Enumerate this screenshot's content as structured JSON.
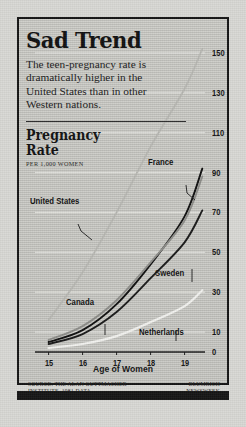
{
  "title": "Sad Trend",
  "intro": "The teen-pregnancy rate is dramatically higher in the United States than in other Western nations.",
  "axis_block": {
    "heading_line1": "Pregnancy",
    "heading_line2": "Rate",
    "units": "PER 1,000 WOMEN"
  },
  "credits": {
    "source": "SOURCE: THE ALAN GUTTMACHER INSTITUTE, 1981 DATA.",
    "artist_line1": "BLUMRICH",
    "artist_line2": "NEWSWEEK"
  },
  "colors": {
    "background": "#d9d9d5",
    "panel": "#cdcdc8",
    "frame": "#151515",
    "ink": "#121212",
    "united_states": "#b9b9b4",
    "france": "#101010",
    "sweden": "#1a1a1a",
    "canada": "#8e8e8a",
    "netherlands": "#f2f2ef",
    "gridline": "#e7e7e3"
  },
  "chart_data": {
    "type": "line",
    "title": "Pregnancy Rate",
    "xlabel": "Age of Women",
    "ylabel": "PER 1,000 WOMEN",
    "x": [
      15,
      16,
      17,
      18,
      19
    ],
    "xticklabels": [
      "15",
      "16",
      "17",
      "18",
      "19"
    ],
    "yticklabels": [
      "0",
      "10",
      "30",
      "50",
      "70",
      "90",
      "110",
      "130",
      "150"
    ],
    "ytickvalues": [
      0,
      10,
      30,
      50,
      70,
      90,
      110,
      130,
      150
    ],
    "ylim": [
      0,
      160
    ],
    "xlim": [
      14.6,
      19.6
    ],
    "grid": true,
    "legend": "inline-labels",
    "series": [
      {
        "name": "United States",
        "color": "#b9b9b4",
        "values": [
          16,
          40,
          70,
          103,
          132
        ],
        "end_value": 152
      },
      {
        "name": "France",
        "color": "#101010",
        "values": [
          5,
          11,
          24,
          44,
          68
        ],
        "end_value": 92
      },
      {
        "name": "Sweden",
        "color": "#1a1a1a",
        "values": [
          4,
          9,
          20,
          37,
          55
        ],
        "end_value": 71
      },
      {
        "name": "Canada",
        "color": "#8e8e8a",
        "values": [
          6,
          13,
          26,
          45,
          66
        ],
        "end_value": 88
      },
      {
        "name": "Netherlands",
        "color": "#f2f2ef",
        "values": [
          2,
          4,
          8,
          15,
          23
        ],
        "end_value": 31
      }
    ],
    "annotations": [
      {
        "label": "United States",
        "x": 30,
        "y": 196
      },
      {
        "label": "France",
        "x": 148,
        "y": 157
      },
      {
        "label": "Sweden",
        "x": 155,
        "y": 268
      },
      {
        "label": "Canada",
        "x": 66,
        "y": 297
      },
      {
        "label": "Netherlands",
        "x": 139,
        "y": 327
      }
    ]
  }
}
